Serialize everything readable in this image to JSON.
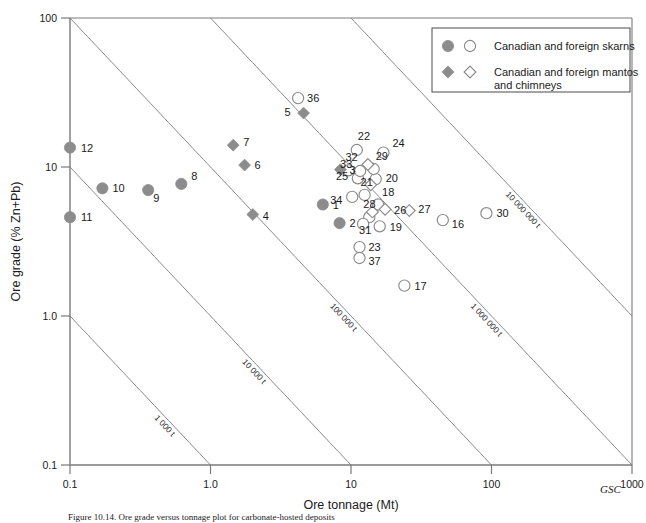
{
  "figure": {
    "gsc_mark": "GSC",
    "caption_partial": "Figure 10.14. Ore grade versus tonnage plot for carbonate-hosted deposits"
  },
  "legend": {
    "items": [
      {
        "markers": [
          "filled-circle",
          "open-circle"
        ],
        "label": "Canadian and foreign skarns"
      },
      {
        "markers": [
          "filled-diamond",
          "open-diamond"
        ],
        "label": "Canadian and foreign mantos and chimneys"
      }
    ]
  },
  "colors": {
    "marker_fill": "#8c8c8c",
    "marker_stroke": "#8a8a8a",
    "open_fill": "#ffffff",
    "axis": "#7a7a7a",
    "isopleth": "#7a7a7a",
    "text": "#1a1a1a"
  },
  "chart_data": {
    "type": "scatter",
    "title": "",
    "xlabel": "Ore tonnage (Mt)",
    "ylabel": "Ore grade (% Zn+Pb)",
    "xscale": "log",
    "yscale": "log",
    "xlim": [
      0.1,
      1000
    ],
    "ylim": [
      0.1,
      100
    ],
    "xticks": [
      "0.1",
      "1.0",
      "10",
      "100",
      "1000"
    ],
    "xtick_values": [
      0.1,
      1,
      10,
      100,
      1000
    ],
    "yticks": [
      "0.1",
      "1.0",
      "10",
      "100"
    ],
    "ytick_values": [
      0.1,
      1,
      10,
      100
    ],
    "grid": false,
    "legend_position": "top-right",
    "isopleths": [
      {
        "label": "1 000 t",
        "tonnes": 1000
      },
      {
        "label": "10 000 t",
        "tonnes": 10000
      },
      {
        "label": "100 000 t",
        "tonnes": 100000
      },
      {
        "label": "1 000 000 t",
        "tonnes": 1000000
      },
      {
        "label": "10 000 000 t",
        "tonnes": 10000000
      }
    ],
    "series": [
      {
        "name": "Canadian and foreign skarns",
        "marker": "circle",
        "points": [
          {
            "id": "1",
            "x": 6.3,
            "y": 5.6,
            "fill": "filled",
            "lx": 10,
            "ly": 4
          },
          {
            "id": "2",
            "x": 8.3,
            "y": 4.2,
            "fill": "filled",
            "lx": 10,
            "ly": 4
          },
          {
            "id": "8",
            "x": 0.62,
            "y": 7.7,
            "fill": "filled",
            "lx": 10,
            "ly": -4
          },
          {
            "id": "9",
            "x": 0.36,
            "y": 7.0,
            "fill": "filled",
            "lx": 5,
            "ly": 12
          },
          {
            "id": "10",
            "x": 0.17,
            "y": 7.2,
            "fill": "filled",
            "lx": 10,
            "ly": 4
          },
          {
            "id": "11",
            "x": 0.1,
            "y": 4.6,
            "fill": "filled",
            "lx": 11,
            "ly": 4
          },
          {
            "id": "12",
            "x": 0.1,
            "y": 13.5,
            "fill": "filled",
            "lx": 11,
            "ly": 4
          },
          {
            "id": "16",
            "x": 45,
            "y": 4.4,
            "fill": "open",
            "lx": 9,
            "ly": 8
          },
          {
            "id": "17",
            "x": 24,
            "y": 1.6,
            "fill": "open",
            "lx": 10,
            "ly": 4
          },
          {
            "id": "19",
            "x": 16,
            "y": 4.0,
            "fill": "open",
            "lx": 10,
            "ly": 5
          },
          {
            "id": "20",
            "x": 15,
            "y": 8.3,
            "fill": "open",
            "lx": 10,
            "ly": 3
          },
          {
            "id": "21",
            "x": 12.5,
            "y": 6.5,
            "fill": "open",
            "lx": -4,
            "ly": -9
          },
          {
            "id": "22",
            "x": 11,
            "y": 13.0,
            "fill": "open",
            "lx": 1,
            "ly": -10
          },
          {
            "id": "23",
            "x": 11.5,
            "y": 2.9,
            "fill": "open",
            "lx": 9,
            "ly": 4
          },
          {
            "id": "24",
            "x": 17,
            "y": 12.5,
            "fill": "open",
            "lx": 9,
            "ly": -6
          },
          {
            "id": "25",
            "x": 11.2,
            "y": 8.4,
            "fill": "open",
            "lx": -22,
            "ly": 2
          },
          {
            "id": "28",
            "x": 13.5,
            "y": 4.6,
            "fill": "open",
            "lx": -6,
            "ly": -9
          },
          {
            "id": "29",
            "x": 14.5,
            "y": 9.7,
            "fill": "open",
            "lx": 2,
            "ly": -9
          },
          {
            "id": "30",
            "x": 92,
            "y": 4.9,
            "fill": "open",
            "lx": 10,
            "ly": 4
          },
          {
            "id": "32",
            "x": 9.6,
            "y": 9.5,
            "fill": "open",
            "lx": -3,
            "ly": -9
          },
          {
            "id": "33",
            "x": 11.6,
            "y": 9.4,
            "fill": "open",
            "lx": -20,
            "ly": -3
          },
          {
            "id": "34",
            "x": 10.2,
            "y": 6.3,
            "fill": "open",
            "lx": -22,
            "ly": 7
          },
          {
            "id": "36",
            "x": 4.2,
            "y": 29,
            "fill": "open",
            "lx": 9,
            "ly": 4
          },
          {
            "id": "37",
            "x": 11.5,
            "y": 2.45,
            "fill": "open",
            "lx": 9,
            "ly": 7
          },
          {
            "id": "18",
            "x": 15.6,
            "y": 5.6,
            "fill": "open",
            "lx": 4,
            "ly": -9
          },
          {
            "id": "31",
            "x": 12.2,
            "y": 4.15,
            "fill": "open",
            "lx": -4,
            "ly": 10
          }
        ]
      },
      {
        "name": "Canadian and foreign mantos and chimneys",
        "marker": "diamond",
        "points": [
          {
            "id": "3",
            "x": 8.4,
            "y": 9.6,
            "fill": "filled",
            "lx": 9,
            "ly": 4
          },
          {
            "id": "4",
            "x": 2.0,
            "y": 4.8,
            "fill": "filled",
            "lx": 10,
            "ly": 5
          },
          {
            "id": "5",
            "x": 4.6,
            "y": 23,
            "fill": "filled",
            "lx": -19,
            "ly": 3
          },
          {
            "id": "6",
            "x": 1.75,
            "y": 10.3,
            "fill": "filled",
            "lx": 10,
            "ly": 4
          },
          {
            "id": "7",
            "x": 1.45,
            "y": 14.0,
            "fill": "filled",
            "lx": 10,
            "ly": 1
          },
          {
            "id": "26",
            "x": 17.5,
            "y": 5.2,
            "fill": "open",
            "lx": 9,
            "ly": 5
          },
          {
            "id": "27",
            "x": 26,
            "y": 5.1,
            "fill": "open",
            "lx": 9,
            "ly": 2
          },
          {
            "id": "29b",
            "x": 13.2,
            "y": 10.4,
            "fill": "open",
            "lx": 0,
            "ly": 0
          },
          {
            "id": "20b",
            "x": 13.8,
            "y": 7.6,
            "fill": "open",
            "lx": 0,
            "ly": 0
          },
          {
            "id": "28b",
            "x": 14.2,
            "y": 5.0,
            "fill": "open",
            "lx": 0,
            "ly": 0
          }
        ]
      }
    ]
  }
}
